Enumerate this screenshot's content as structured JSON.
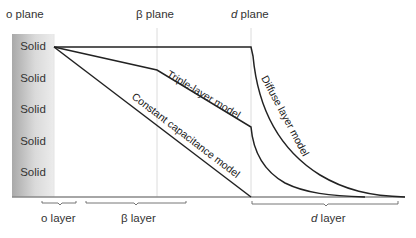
{
  "planes": [
    {
      "label": "o plane",
      "x": 54
    },
    {
      "label": "β plane",
      "x": 157
    },
    {
      "label_italic": "d",
      "label_rest": " plane",
      "x": 251
    }
  ],
  "solid": {
    "labels": [
      "Solid",
      "Solid",
      "Solid",
      "Solid",
      "Solid"
    ]
  },
  "layers": [
    {
      "label": "o layer"
    },
    {
      "label": "β layer"
    },
    {
      "label_italic": "d",
      "label_rest": " layer"
    }
  ],
  "curves": [
    {
      "label": "Constant capacitance model"
    },
    {
      "label": "Triple-layer model"
    },
    {
      "label": "Diffuse layer model"
    }
  ],
  "colors": {
    "line": "#222222",
    "plane_line": "#d8d8d8",
    "axis": "#888888"
  }
}
